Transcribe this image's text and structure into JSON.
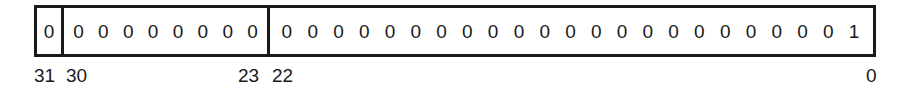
{
  "diagram": {
    "title": "",
    "fields": [
      {
        "name": "sign",
        "bits": [
          "0"
        ]
      },
      {
        "name": "exponent",
        "bits": [
          "0",
          "0",
          "0",
          "0",
          "0",
          "0",
          "0",
          "0"
        ]
      },
      {
        "name": "mantissa",
        "bits": [
          "0",
          "0",
          "0",
          "0",
          "0",
          "0",
          "0",
          "0",
          "0",
          "0",
          "0",
          "0",
          "0",
          "0",
          "0",
          "0",
          "0",
          "0",
          "0",
          "0",
          "0",
          "0",
          "1"
        ]
      }
    ],
    "labels": {
      "b31": "31",
      "b30": "30",
      "b23": "23",
      "b22": "22",
      "b0": "0"
    }
  }
}
